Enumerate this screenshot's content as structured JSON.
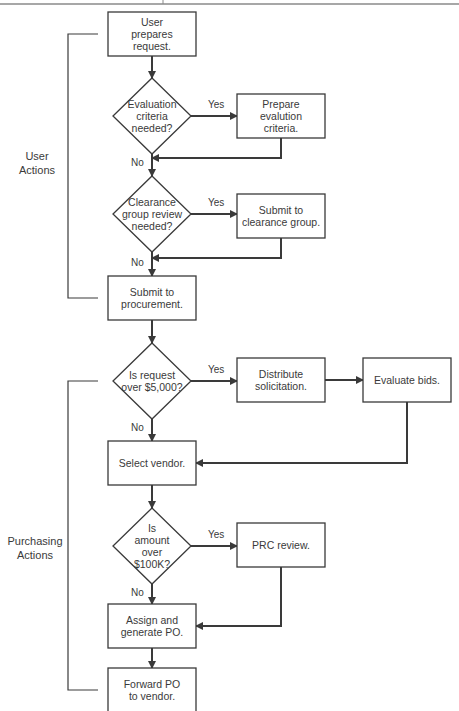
{
  "diagram": {
    "type": "flowchart",
    "colors": {
      "line": "#3a3a3a",
      "text": "#3a3a3a",
      "background": "#ffffff",
      "rule": "#8a8a8a"
    },
    "groups": [
      {
        "id": "user",
        "label": [
          "User",
          "Actions"
        ]
      },
      {
        "id": "purchasing",
        "label": [
          "Purchasing",
          "Actions"
        ]
      }
    ],
    "nodes": [
      {
        "id": "n1",
        "shape": "box",
        "lines": [
          "User",
          "prepares",
          "request."
        ]
      },
      {
        "id": "d1",
        "shape": "diamond",
        "lines": [
          "Evaluation",
          "criteria",
          "needed?"
        ]
      },
      {
        "id": "n2",
        "shape": "box",
        "lines": [
          "Prepare",
          "evalution",
          "criteria."
        ]
      },
      {
        "id": "d2",
        "shape": "diamond",
        "lines": [
          "Clearance",
          "group review",
          "needed?"
        ]
      },
      {
        "id": "n3",
        "shape": "box",
        "lines": [
          "Submit to",
          "clearance group."
        ]
      },
      {
        "id": "n4",
        "shape": "box",
        "lines": [
          "Submit to",
          "procurement."
        ]
      },
      {
        "id": "d3",
        "shape": "diamond",
        "lines": [
          "Is request",
          "over $5,000?"
        ]
      },
      {
        "id": "n5",
        "shape": "box",
        "lines": [
          "Distribute",
          "solicitation."
        ]
      },
      {
        "id": "n6",
        "shape": "box",
        "lines": [
          "Evaluate bids."
        ]
      },
      {
        "id": "n7",
        "shape": "box",
        "lines": [
          "Select vendor."
        ]
      },
      {
        "id": "d4",
        "shape": "diamond",
        "lines": [
          "Is",
          "amount",
          "over",
          "$100K?"
        ]
      },
      {
        "id": "n8",
        "shape": "box",
        "lines": [
          "PRC review."
        ]
      },
      {
        "id": "n9",
        "shape": "box",
        "lines": [
          "Assign and",
          "generate PO."
        ]
      },
      {
        "id": "n10",
        "shape": "box",
        "lines": [
          "Forward PO",
          "to vendor."
        ]
      }
    ],
    "edges": [
      {
        "from": "n1",
        "to": "d1",
        "label": ""
      },
      {
        "from": "d1",
        "to": "n2",
        "label": "Yes"
      },
      {
        "from": "d1",
        "to": "d2",
        "label": "No"
      },
      {
        "from": "n2",
        "to": "d2",
        "label": ""
      },
      {
        "from": "d2",
        "to": "n3",
        "label": "Yes"
      },
      {
        "from": "d2",
        "to": "n4",
        "label": "No"
      },
      {
        "from": "n3",
        "to": "n4",
        "label": ""
      },
      {
        "from": "n4",
        "to": "d3",
        "label": ""
      },
      {
        "from": "d3",
        "to": "n5",
        "label": "Yes"
      },
      {
        "from": "d3",
        "to": "n7",
        "label": "No"
      },
      {
        "from": "n5",
        "to": "n6",
        "label": ""
      },
      {
        "from": "n6",
        "to": "n7",
        "label": ""
      },
      {
        "from": "n7",
        "to": "d4",
        "label": ""
      },
      {
        "from": "d4",
        "to": "n8",
        "label": "Yes"
      },
      {
        "from": "d4",
        "to": "n9",
        "label": "No"
      },
      {
        "from": "n8",
        "to": "n9",
        "label": ""
      },
      {
        "from": "n9",
        "to": "n10",
        "label": ""
      }
    ]
  }
}
